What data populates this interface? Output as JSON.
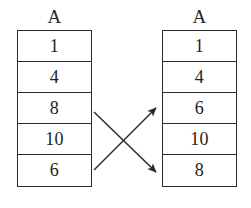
{
  "diagram": {
    "type": "array-swap-illustration",
    "background_color": "#ffffff",
    "ink_color": "#2b2b2b",
    "arrays": [
      {
        "id": "before",
        "position": "left",
        "header": "A",
        "cells": [
          "1",
          "4",
          "8",
          "10",
          "6"
        ]
      },
      {
        "id": "after",
        "position": "right",
        "header": "A",
        "cells": [
          "1",
          "4",
          "6",
          "10",
          "8"
        ]
      }
    ],
    "arrows": [
      {
        "id": "arrow-up",
        "direction": "up-right",
        "from_row_index": 4,
        "to_row_index": 2,
        "from_value": "6",
        "to_value": "6"
      },
      {
        "id": "arrow-down",
        "direction": "down-right",
        "from_row_index": 2,
        "to_row_index": 4,
        "from_value": "8",
        "to_value": "8"
      }
    ]
  }
}
